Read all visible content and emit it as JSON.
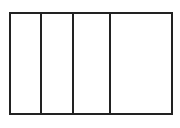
{
  "diagram": {
    "type": "partitioned-rectangle",
    "stroke_color": "#222222",
    "background": "#ffffff",
    "frame": {
      "left": 9,
      "top": 12,
      "right": 172,
      "bottom": 114,
      "stroke": 2
    },
    "dividers_x": [
      40,
      72,
      109
    ],
    "sections": 4
  }
}
